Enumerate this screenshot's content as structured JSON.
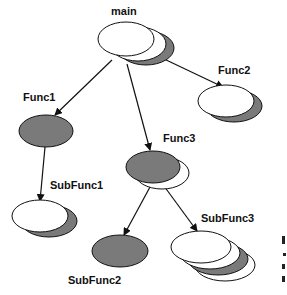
{
  "diagram": {
    "type": "call-tree",
    "colors": {
      "white_fill": "#ffffff",
      "gray_fill": "#7a7a7a",
      "stroke": "#111111",
      "background": "#ffffff"
    },
    "nodes": [
      {
        "id": "main",
        "label": "main",
        "instances": 3,
        "front": "white"
      },
      {
        "id": "func1",
        "label": "Func1",
        "instances": 1,
        "front": "gray"
      },
      {
        "id": "func2",
        "label": "Func2",
        "instances": 2,
        "front": "white"
      },
      {
        "id": "func3",
        "label": "Func3",
        "instances": 2,
        "front": "gray"
      },
      {
        "id": "subfunc1",
        "label": "SubFunc1",
        "instances": 2,
        "front": "white"
      },
      {
        "id": "subfunc2",
        "label": "SubFunc2",
        "instances": 1,
        "front": "gray"
      },
      {
        "id": "subfunc3",
        "label": "SubFunc3",
        "instances": 4,
        "front": "white"
      }
    ],
    "edges": [
      {
        "from": "main",
        "to": "func1"
      },
      {
        "from": "main",
        "to": "func2"
      },
      {
        "from": "main",
        "to": "func3"
      },
      {
        "from": "func1",
        "to": "subfunc1"
      },
      {
        "from": "func3",
        "to": "subfunc2"
      },
      {
        "from": "func3",
        "to": "subfunc3"
      }
    ]
  }
}
